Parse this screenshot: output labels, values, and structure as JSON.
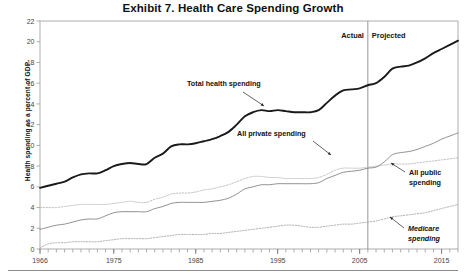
{
  "figure": {
    "title": "Exhibit 7. Health Care Spending Growth",
    "ylabel": "Health spending as a percent of GDP",
    "period_labels": {
      "actual": "Actual",
      "projected": "Projected"
    },
    "annotations": {
      "total": "Total health spending",
      "private": "All private spending",
      "public_line1": "All public",
      "public_line2": "spending",
      "medicare_line1": "Medicare",
      "medicare_line2": "spending"
    }
  },
  "chart_data": {
    "type": "line",
    "title": "Exhibit 7. Health Care Spending Growth",
    "xlabel": "",
    "ylabel": "Health spending as a percent of GDP",
    "xlim": [
      1966,
      2017
    ],
    "ylim": [
      0,
      22
    ],
    "ytick_step": 2,
    "yticks": [
      0,
      2,
      4,
      6,
      8,
      10,
      12,
      14,
      16,
      18,
      20,
      22
    ],
    "xticks_labeled": [
      1966,
      1975,
      1985,
      1995,
      2005,
      2015
    ],
    "xtick_minor_step": 1,
    "grid": false,
    "legend": "annotations-inline",
    "divider_year": 2006,
    "divider_labels": [
      "Actual",
      "Projected"
    ],
    "x": [
      1966,
      1967,
      1968,
      1969,
      1970,
      1971,
      1972,
      1973,
      1974,
      1975,
      1976,
      1977,
      1978,
      1979,
      1980,
      1981,
      1982,
      1983,
      1984,
      1985,
      1986,
      1987,
      1988,
      1989,
      1990,
      1991,
      1992,
      1993,
      1994,
      1995,
      1996,
      1997,
      1998,
      1999,
      2000,
      2001,
      2002,
      2003,
      2004,
      2005,
      2006,
      2007,
      2008,
      2009,
      2010,
      2011,
      2012,
      2013,
      2014,
      2015,
      2016,
      2017
    ],
    "series": [
      {
        "name": "Total health spending",
        "style": "thick-solid",
        "color": "#1a1a1a",
        "values": [
          5.9,
          6.1,
          6.3,
          6.5,
          6.9,
          7.2,
          7.3,
          7.3,
          7.6,
          8.0,
          8.2,
          8.3,
          8.2,
          8.2,
          8.8,
          9.2,
          9.9,
          10.1,
          10.1,
          10.2,
          10.4,
          10.6,
          10.9,
          11.3,
          12.0,
          12.8,
          13.2,
          13.4,
          13.3,
          13.4,
          13.3,
          13.2,
          13.2,
          13.2,
          13.4,
          14.1,
          14.8,
          15.3,
          15.4,
          15.5,
          15.8,
          16.0,
          16.6,
          17.4,
          17.6,
          17.7,
          18.0,
          18.4,
          18.9,
          19.3,
          19.7,
          20.1
        ]
      },
      {
        "name": "All private spending",
        "style": "light-dotted",
        "color": "#b8b8b8",
        "values": [
          4.0,
          4.0,
          4.0,
          4.1,
          4.2,
          4.3,
          4.3,
          4.3,
          4.3,
          4.4,
          4.5,
          4.6,
          4.5,
          4.5,
          4.8,
          5.0,
          5.3,
          5.4,
          5.4,
          5.5,
          5.7,
          5.8,
          6.0,
          6.2,
          6.5,
          6.8,
          7.0,
          7.0,
          6.9,
          6.9,
          6.8,
          6.8,
          6.8,
          6.8,
          6.9,
          7.2,
          7.6,
          7.8,
          7.8,
          7.8,
          7.9,
          8.0,
          8.1,
          8.2,
          8.2,
          8.2,
          8.3,
          8.4,
          8.5,
          8.6,
          8.7,
          8.8
        ]
      },
      {
        "name": "All public spending",
        "style": "thin-solid",
        "color": "#6e6e6e",
        "values": [
          1.9,
          2.1,
          2.3,
          2.4,
          2.6,
          2.8,
          2.9,
          2.9,
          3.2,
          3.5,
          3.6,
          3.6,
          3.6,
          3.6,
          3.9,
          4.1,
          4.4,
          4.5,
          4.5,
          4.5,
          4.5,
          4.6,
          4.7,
          4.9,
          5.3,
          5.8,
          6.0,
          6.2,
          6.2,
          6.3,
          6.3,
          6.3,
          6.3,
          6.3,
          6.4,
          6.8,
          7.1,
          7.4,
          7.5,
          7.6,
          7.8,
          7.9,
          8.4,
          9.1,
          9.3,
          9.4,
          9.6,
          9.9,
          10.2,
          10.6,
          10.9,
          11.2
        ]
      },
      {
        "name": "Medicare spending",
        "style": "fine-dotted",
        "color": "#9a9a9a",
        "values": [
          0.1,
          0.5,
          0.6,
          0.6,
          0.7,
          0.7,
          0.7,
          0.7,
          0.8,
          0.9,
          1.0,
          1.0,
          1.0,
          1.0,
          1.1,
          1.2,
          1.3,
          1.4,
          1.4,
          1.4,
          1.4,
          1.5,
          1.5,
          1.6,
          1.7,
          1.8,
          1.9,
          2.0,
          2.1,
          2.2,
          2.3,
          2.3,
          2.2,
          2.1,
          2.1,
          2.2,
          2.3,
          2.4,
          2.4,
          2.5,
          2.6,
          2.7,
          2.9,
          3.1,
          3.2,
          3.3,
          3.4,
          3.5,
          3.7,
          3.9,
          4.1,
          4.3
        ]
      }
    ]
  }
}
